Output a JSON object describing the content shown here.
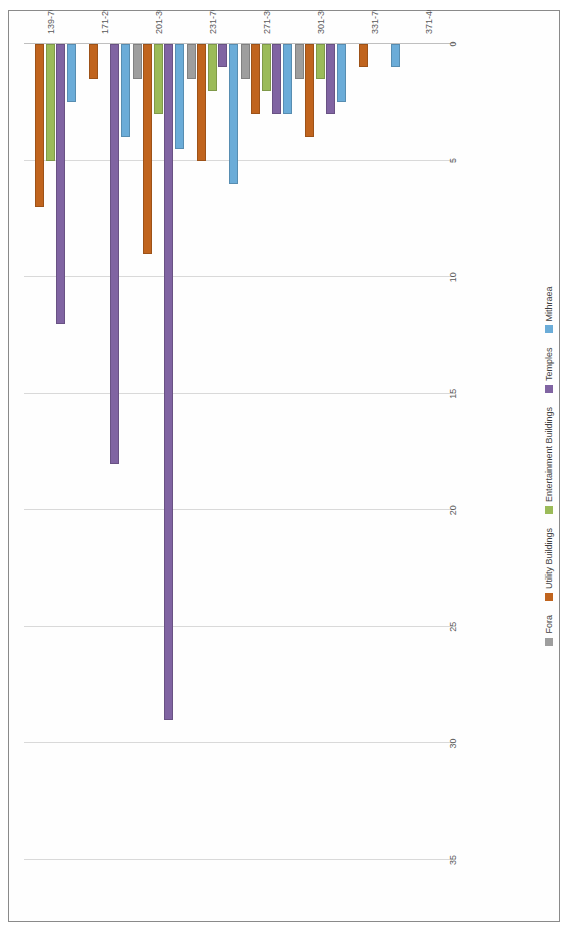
{
  "chart": {
    "type": "bar",
    "orientation": "horizontal",
    "title": "",
    "xlabel": "",
    "ylabel": "",
    "rotated_in_scan": "90"
  },
  "chart_data": {
    "type": "bar",
    "orientation": "horizontal",
    "title": "",
    "xlabel": "",
    "ylabel": "",
    "xlim": [
      0,
      35
    ],
    "grid": true,
    "legend_position": "bottom",
    "tick_labels": [
      "0",
      "5",
      "10",
      "15",
      "20",
      "25",
      "30",
      "35"
    ],
    "ticks": [
      0,
      5,
      10,
      15,
      20,
      25,
      30,
      35
    ],
    "categories": [
      "139-70",
      "171-200",
      "201-30",
      "231-70",
      "271-300",
      "301-30",
      "331-70",
      "371-400"
    ],
    "series": [
      {
        "name": "Fora",
        "color": "#9E9E9E",
        "values": [
          0,
          0,
          1.5,
          1.5,
          1.5,
          1.5,
          0,
          0
        ]
      },
      {
        "name": "Utility Buildings",
        "color": "#C0641E",
        "values": [
          7,
          1.5,
          9,
          5,
          3,
          4,
          1,
          0
        ]
      },
      {
        "name": "Entertainment Buildings",
        "color": "#9BBB59",
        "values": [
          5,
          0,
          3,
          2,
          2,
          1.5,
          0,
          0
        ]
      },
      {
        "name": "Temples",
        "color": "#8064A2",
        "values": [
          12,
          18,
          29,
          1,
          3,
          3,
          0,
          0
        ]
      },
      {
        "name": "Mithraea",
        "color": "#6BACD8",
        "values": [
          2.5,
          4,
          4.5,
          6,
          3,
          2.5,
          1,
          0
        ]
      }
    ]
  },
  "legend": {
    "items": [
      {
        "label": "Fora",
        "color": "#9E9E9E"
      },
      {
        "label": "Utility Buildings",
        "color": "#C0641E"
      },
      {
        "label": "Entertainment Buildings",
        "color": "#9BBB59"
      },
      {
        "label": "Temples",
        "color": "#8064A2"
      },
      {
        "label": "Mithraea",
        "color": "#6BACD8"
      }
    ]
  }
}
